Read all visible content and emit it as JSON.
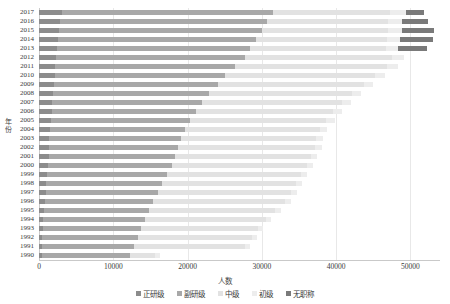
{
  "chart_data": {
    "type": "bar",
    "orientation": "horizontal",
    "stacked": true,
    "title": "",
    "xlabel": "人数",
    "ylabel": "年份",
    "xlim": [
      0,
      54000
    ],
    "ylim_categories": 28,
    "grid": true,
    "legend_position": "bottom",
    "xticks": [
      0,
      10000,
      20000,
      30000,
      40000,
      50000
    ],
    "xtick_labels": [
      "0",
      "10000",
      "20000",
      "30000",
      "40000",
      "50000"
    ],
    "categories": [
      "2017",
      "2016",
      "2015",
      "2014",
      "2013",
      "2012",
      "2011",
      "2010",
      "2009",
      "2008",
      "2007",
      "2006",
      "2005",
      "2004",
      "2003",
      "2002",
      "2001",
      "2000",
      "1999",
      "1998",
      "1997",
      "1996",
      "1995",
      "1994",
      "1993",
      "1992",
      "1991",
      "1990"
    ],
    "series": [
      {
        "name": "正研级",
        "color": "#8c8c8c",
        "values": [
          3100,
          2850,
          2700,
          2550,
          2400,
          2300,
          2200,
          2100,
          2000,
          1900,
          1800,
          1700,
          1600,
          1500,
          1400,
          1350,
          1300,
          1250,
          1100,
          1000,
          900,
          800,
          650,
          550,
          500,
          450,
          400,
          350
        ]
      },
      {
        "name": "副研级",
        "color": "#a8a8a8",
        "values": [
          28400,
          27900,
          27300,
          26700,
          26000,
          25500,
          24200,
          23000,
          22100,
          21000,
          20200,
          19400,
          18800,
          18200,
          17700,
          17400,
          17000,
          16600,
          16100,
          15600,
          15100,
          14600,
          14100,
          13700,
          13300,
          12900,
          12400,
          11900
        ]
      },
      {
        "name": "中级",
        "color": "#e2e2e2",
        "values": [
          15800,
          16200,
          17000,
          17600,
          18300,
          19700,
          20400,
          20100,
          19600,
          19200,
          18800,
          18500,
          18300,
          18100,
          18200,
          18400,
          18300,
          18200,
          18100,
          18000,
          17900,
          17700,
          17100,
          16300,
          15700,
          15300,
          14900,
          3400
        ]
      },
      {
        "name": "初级",
        "color": "#ededed",
        "values": [
          2100,
          2000,
          1900,
          1800,
          1700,
          1600,
          1500,
          1400,
          1300,
          1200,
          1200,
          1150,
          1100,
          1050,
          1000,
          950,
          900,
          880,
          850,
          830,
          800,
          780,
          750,
          720,
          700,
          680,
          650,
          620
        ]
      },
      {
        "name": "无职称",
        "color": "#7a7a7a",
        "values": [
          2400,
          3400,
          4300,
          4400,
          3900,
          0,
          0,
          0,
          0,
          0,
          0,
          0,
          0,
          0,
          0,
          0,
          0,
          0,
          0,
          0,
          0,
          0,
          0,
          0,
          0,
          0,
          0,
          0
        ]
      }
    ]
  },
  "legend": {
    "items": [
      {
        "label": "正研级"
      },
      {
        "label": "副研级"
      },
      {
        "label": "中级"
      },
      {
        "label": "初级"
      },
      {
        "label": "无职称"
      }
    ]
  }
}
